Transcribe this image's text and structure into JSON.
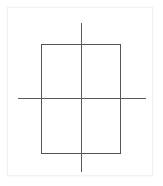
{
  "figure": {
    "canvas": {
      "width": 163,
      "height": 186,
      "background_color": "#ffffff"
    },
    "card": {
      "x": 7,
      "y": 7,
      "width": 146,
      "height": 169,
      "fill_color": "#ffffff",
      "border_color": "#f2f2f2"
    },
    "shapes": [
      {
        "name": "rectangle",
        "type": "rect",
        "x": 41,
        "y": 44,
        "width": 79,
        "height": 109,
        "stroke_color": "#555555",
        "stroke_width": 1,
        "fill": "none"
      },
      {
        "name": "vertical-axis-line",
        "type": "line",
        "x1": 81,
        "y1": 23,
        "x2": 81,
        "y2": 172,
        "stroke_color": "#5a5a5a",
        "stroke_width": 1
      },
      {
        "name": "horizontal-axis-line",
        "type": "line",
        "x1": 18,
        "y1": 98,
        "x2": 146,
        "y2": 98,
        "stroke_color": "#5a5a5a",
        "stroke_width": 1
      }
    ],
    "intersection_point": {
      "name": "axes-intersection",
      "x": 81,
      "y": 98
    },
    "labels": [],
    "annotations": []
  }
}
